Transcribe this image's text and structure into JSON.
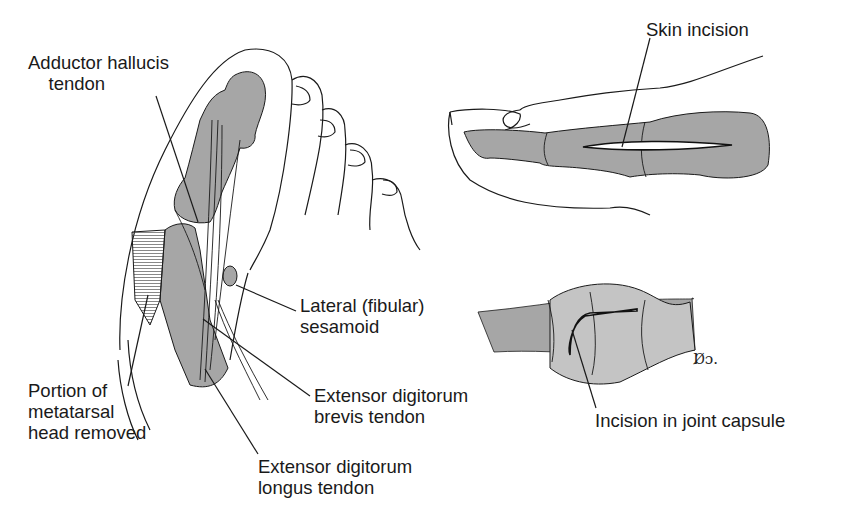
{
  "figure": {
    "panels": [
      {
        "id": "foot",
        "description": "Dorsal view of forefoot with first metatarsophalangeal joint exposed"
      },
      {
        "id": "toe-lateral",
        "description": "Lateral view of great toe showing skin incision"
      },
      {
        "id": "joint-capsule",
        "description": "Close-up of joint showing capsule incision"
      }
    ],
    "labels": {
      "adductor": "Adductor hallucis\n    tendon",
      "sesamoid": "Lateral (fibular)\nsesamoid",
      "portion": "Portion of\nmetatarsal\nhead removed",
      "brevis": "Extensor digitorum\nbrevis tendon",
      "longus": "Extensor digitorum\nlongus tendon",
      "skin": "Skin incision",
      "capsule": "Incision in joint capsule"
    },
    "signature": "D̸þo."
  },
  "colors": {
    "line": "#1a1a1a",
    "bone_fill": "#a6a6a6",
    "capsule_fill": "#c4c4c4",
    "background": "#ffffff"
  }
}
